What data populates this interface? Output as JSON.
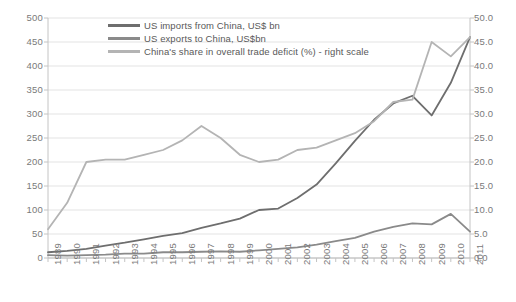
{
  "chart_data": {
    "type": "line",
    "title": "",
    "xlabel": "",
    "ylabel": "",
    "y2label": "",
    "grid": true,
    "legend_position": "top-center",
    "x": [
      1989,
      1990,
      1991,
      1992,
      1993,
      1994,
      1995,
      1996,
      1997,
      1998,
      1999,
      2000,
      2001,
      2002,
      2003,
      2004,
      2005,
      2006,
      2007,
      2008,
      2009,
      2010,
      2011
    ],
    "categories": [
      "1989",
      "1990",
      "1991",
      "1992",
      "1993",
      "1994",
      "1995",
      "1996",
      "1997",
      "1998",
      "1999",
      "2000",
      "2001",
      "2002",
      "2003",
      "2004",
      "2005",
      "2006",
      "2007",
      "2008",
      "2009",
      "2010",
      "2011"
    ],
    "ylim": [
      0,
      500
    ],
    "yticks": [
      0,
      50,
      100,
      150,
      200,
      250,
      300,
      350,
      400,
      450,
      500
    ],
    "ytick_labels": [
      "0",
      "50",
      "100",
      "150",
      "200",
      "250",
      "300",
      "350",
      "400",
      "450",
      "500"
    ],
    "y2lim": [
      0,
      50
    ],
    "y2ticks": [
      0,
      5,
      10,
      15,
      20,
      25,
      30,
      35,
      40,
      45,
      50
    ],
    "y2tick_labels": [
      "0.0",
      "5.0",
      "10.0",
      "15.0",
      "20.0",
      "25.0",
      "30.0",
      "35.0",
      "40.0",
      "45.0",
      "50.0"
    ],
    "series": [
      {
        "name": "US imports from China, US$ bn",
        "axis": "left",
        "color": "#6e6e6e",
        "values": [
          12,
          15,
          19,
          26,
          32,
          39,
          46,
          52,
          63,
          72,
          82,
          100,
          103,
          125,
          153,
          197,
          244,
          288,
          322,
          338,
          297,
          365,
          460
        ]
      },
      {
        "name": "US exports to China, US$bn",
        "axis": "left",
        "color": "#8a8a8a",
        "values": [
          6,
          5,
          6,
          7,
          9,
          9,
          12,
          12,
          13,
          14,
          13,
          16,
          19,
          22,
          28,
          35,
          42,
          55,
          65,
          72,
          70,
          92,
          55
        ]
      },
      {
        "name": "China's share in overall trade deficit (%) - right scale",
        "axis": "right",
        "color": "#b4b4b4",
        "values": [
          6.0,
          11.5,
          20.0,
          20.5,
          20.5,
          21.5,
          22.5,
          24.5,
          27.5,
          25.0,
          21.5,
          20.0,
          20.5,
          22.5,
          23.0,
          24.5,
          26.0,
          28.5,
          32.5,
          33.0,
          45.0,
          42.0,
          46.0
        ]
      }
    ]
  },
  "legend": {
    "items": [
      {
        "label": "US imports from China, US$ bn",
        "color": "#6e6e6e"
      },
      {
        "label": "US exports to China, US$bn",
        "color": "#8a8a8a"
      },
      {
        "label": "China's share in overall trade deficit (%) - right scale",
        "color": "#b4b4b4"
      }
    ]
  }
}
